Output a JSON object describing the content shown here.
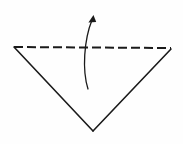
{
  "figure": {
    "title": "Paper folding diagram: downward triangle with upward fold arrow",
    "canvas": {
      "width": 183,
      "height": 144,
      "background": "#fefefe"
    },
    "style": {
      "stroke_color": "#1a1a1a",
      "fold_line_color": "#1a1a1a",
      "arrow_color": "#1a1a1a",
      "solid_stroke_width": 1.6,
      "fold_stroke_width": 2.0,
      "arrow_stroke_width": 1.3,
      "dash_pattern": "9 4"
    },
    "shapes": [
      {
        "name": "triangle-left-edge",
        "kind": "line",
        "line_style": "solid",
        "from": {
          "x": 14,
          "y": 47
        },
        "to": {
          "x": 93,
          "y": 131
        }
      },
      {
        "name": "triangle-right-edge",
        "kind": "line",
        "line_style": "solid",
        "from": {
          "x": 171,
          "y": 49
        },
        "to": {
          "x": 93,
          "y": 131
        }
      },
      {
        "name": "fold-line",
        "kind": "line",
        "line_style": "dashed",
        "from": {
          "x": 14,
          "y": 47
        },
        "to": {
          "x": 171,
          "y": 48
        }
      }
    ],
    "annotations": [
      {
        "name": "fold-arrow",
        "kind": "curved-arrow",
        "direction": "upward",
        "path": "M 88 89 C 82 70, 84 40, 92 20",
        "head": {
          "tip": {
            "x": 93.5,
            "y": 15
          },
          "points": "93.5,15 88.4,22.6 96.2,22.0",
          "size": 8
        }
      }
    ],
    "vertices": [
      {
        "name": "vertex-top-left",
        "x": 14,
        "y": 47
      },
      {
        "name": "vertex-top-right",
        "x": 171,
        "y": 48
      },
      {
        "name": "vertex-bottom",
        "x": 93,
        "y": 131
      }
    ]
  }
}
